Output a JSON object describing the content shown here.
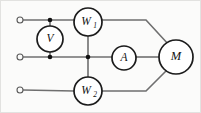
{
  "diagram": {
    "type": "schematic",
    "canvas": {
      "width": 201,
      "height": 113,
      "background": "#fbfbfa"
    },
    "colors": {
      "wire": "#6f6f6f",
      "component_outline": "#1b1b1b",
      "node": "#111111",
      "terminal": "#5a5a5a",
      "label": "#111111"
    },
    "components": [
      {
        "id": "V",
        "label": "V",
        "subscript": "",
        "name": "voltmeter",
        "cx": 50,
        "cy": 39,
        "r": 13
      },
      {
        "id": "W1",
        "label": "W",
        "subscript": "1",
        "name": "wattmeter-1",
        "cx": 88,
        "cy": 22,
        "r": 14
      },
      {
        "id": "W2",
        "label": "W",
        "subscript": "2",
        "name": "wattmeter-2",
        "cx": 88,
        "cy": 91,
        "r": 14
      },
      {
        "id": "A",
        "label": "A",
        "subscript": "",
        "name": "ammeter",
        "cx": 124,
        "cy": 58,
        "r": 12
      },
      {
        "id": "M",
        "label": "M",
        "subscript": "",
        "name": "motor",
        "cx": 176,
        "cy": 57,
        "r": 17
      }
    ],
    "terminals": [
      {
        "id": "T1",
        "name": "terminal-line-1",
        "cx": 20,
        "cy": 20,
        "r": 3
      },
      {
        "id": "T2",
        "name": "terminal-line-2",
        "cx": 20,
        "cy": 57,
        "r": 3
      },
      {
        "id": "T3",
        "name": "terminal-line-3",
        "cx": 20,
        "cy": 90,
        "r": 3
      }
    ],
    "nodes": [
      {
        "id": "N1",
        "name": "node-top",
        "cx": 50,
        "cy": 20,
        "r": 2.3
      },
      {
        "id": "N2",
        "name": "node-middle-left",
        "cx": 50,
        "cy": 57,
        "r": 2.3
      },
      {
        "id": "N3",
        "name": "node-middle-mid",
        "cx": 88,
        "cy": 57,
        "r": 2.3
      }
    ],
    "wires": [
      {
        "id": "w-top-left",
        "name": "wire-terminal1-to-w1",
        "d": "M 23 20 L 74 20"
      },
      {
        "id": "w-mid-left",
        "name": "wire-terminal2-to-a",
        "d": "M 23 57 L 112 57"
      },
      {
        "id": "w-bot-left",
        "name": "wire-terminal3-to-w2",
        "d": "M 23 90 L 74 91"
      },
      {
        "id": "w-vert-v-top",
        "name": "wire-v-to-top-line",
        "d": "M 50 20 L 50 26"
      },
      {
        "id": "w-vert-v-bot",
        "name": "wire-v-to-mid-line",
        "d": "M 50 52 L 50 57"
      },
      {
        "id": "w-vert-w1",
        "name": "wire-w1-to-mid-node",
        "d": "M 88 36 L 88 57"
      },
      {
        "id": "w-vert-w2",
        "name": "wire-mid-node-to-w2",
        "d": "M 88 57 L 88 77"
      },
      {
        "id": "w-a-to-m",
        "name": "wire-a-to-motor",
        "d": "M 136 57 L 159 57"
      },
      {
        "id": "w-w1-to-m",
        "name": "wire-w1-to-motor",
        "d": "M 102 20 L 146 20 L 169 45"
      },
      {
        "id": "w-w2-to-m",
        "name": "wire-w2-to-motor",
        "d": "M 102 91 L 146 91 L 168 69"
      }
    ]
  }
}
